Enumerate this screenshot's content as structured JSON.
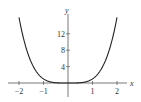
{
  "chart_data": {
    "type": "line",
    "title": "",
    "xlabel": "x",
    "ylabel": "y",
    "function": "y = x^4",
    "xlim": [
      -2,
      2
    ],
    "ylim": [
      0,
      16
    ],
    "x_ticks": [
      -2,
      -1,
      1,
      2
    ],
    "x_tick_labels": [
      "−2",
      "−1",
      "1",
      "2"
    ],
    "y_ticks": [
      4,
      8,
      12
    ],
    "y_tick_labels": [
      "4",
      "8",
      "12"
    ],
    "grid": false,
    "legend": null,
    "series": [
      {
        "name": "y = x^4",
        "x": [
          -2,
          -1.75,
          -1.5,
          -1.25,
          -1,
          -0.75,
          -0.5,
          -0.25,
          0,
          0.25,
          0.5,
          0.75,
          1,
          1.25,
          1.5,
          1.75,
          2
        ],
        "y": [
          16,
          9.38,
          5.06,
          2.44,
          1,
          0.32,
          0.06,
          0.004,
          0,
          0.004,
          0.06,
          0.32,
          1,
          2.44,
          5.06,
          9.38,
          16
        ]
      }
    ]
  }
}
